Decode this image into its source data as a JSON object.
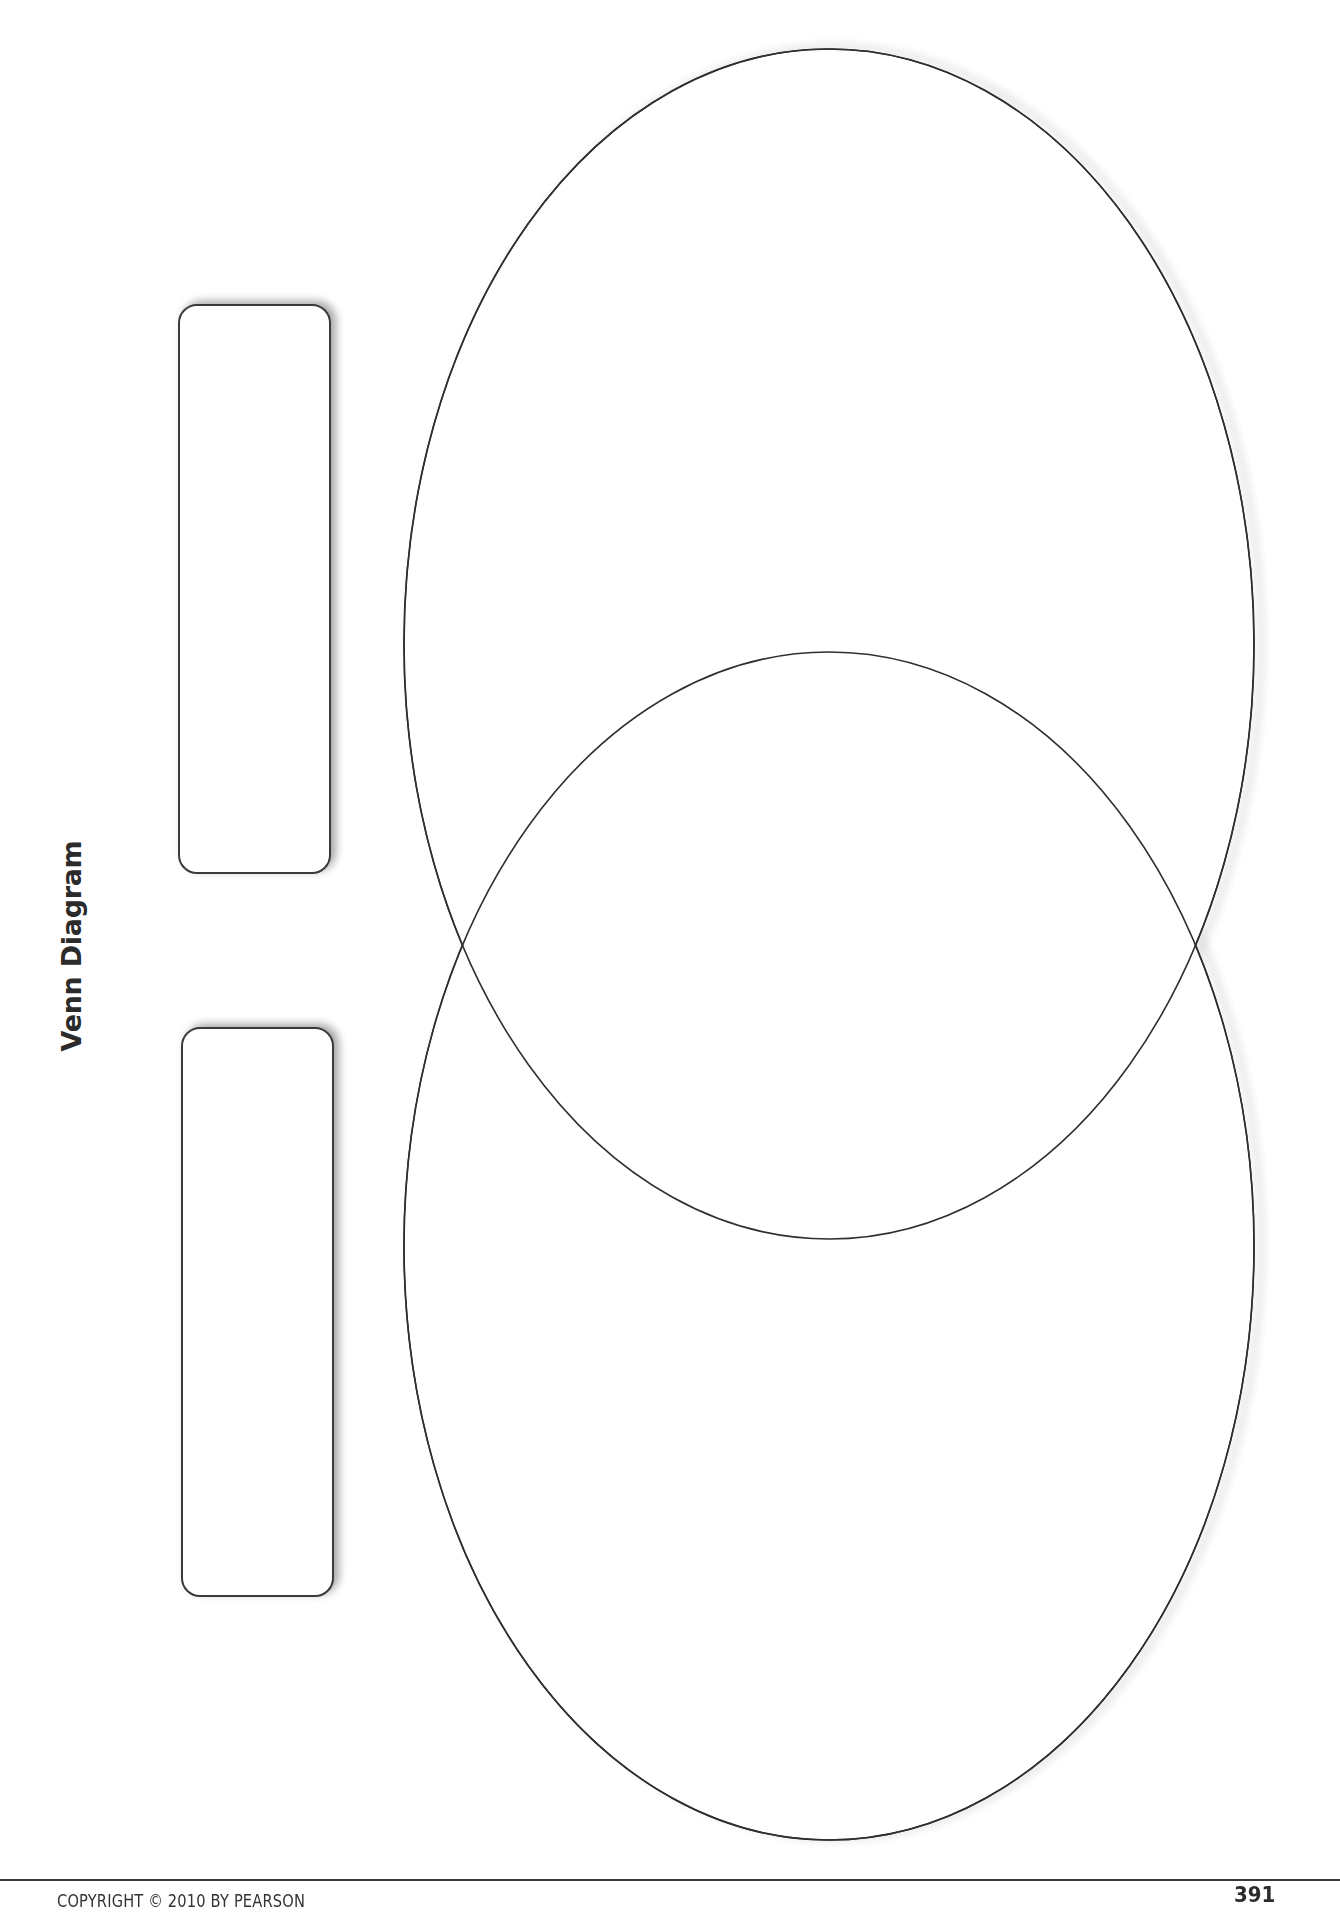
{
  "page": {
    "title": "Venn Diagram",
    "footer": {
      "copyright": "COPYRIGHT © 2010 BY PEARSON",
      "page_number": "391"
    }
  },
  "diagram": {
    "type": "venn",
    "set_count": 2,
    "sets": [
      {
        "id": "set-a",
        "label": ""
      },
      {
        "id": "set-b",
        "label": ""
      }
    ],
    "label_boxes": [
      {
        "for": "set-a",
        "value": ""
      },
      {
        "for": "set-b",
        "value": ""
      }
    ],
    "colors": {
      "stroke": "#2f2f2f",
      "fill": "#ffffff",
      "shadow": "#9a9a9a"
    }
  }
}
